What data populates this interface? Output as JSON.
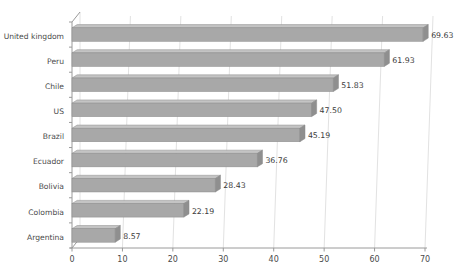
{
  "chart_data": {
    "type": "bar",
    "orientation": "horizontal",
    "title": "",
    "subtitle": "",
    "xlabel": "",
    "ylabel": "",
    "categories": [
      "United kingdom",
      "Peru",
      "Chile",
      "US",
      "Brazil",
      "Ecuador",
      "Bolivia",
      "Colombia",
      "Argentina"
    ],
    "values": [
      69.63,
      61.93,
      51.83,
      47.5,
      45.19,
      36.76,
      28.43,
      22.19,
      8.57
    ],
    "value_labels": [
      "69.63",
      "61.93",
      "51.83",
      "47.50",
      "45.19",
      "36.76",
      "28.43",
      "22.19",
      "8.57"
    ],
    "xlim": [
      0,
      70
    ],
    "xticks": [
      0,
      10,
      20,
      30,
      40,
      50,
      60,
      70
    ],
    "xtick_labels": [
      "0",
      "10",
      "20",
      "30",
      "40",
      "50",
      "60",
      "70"
    ],
    "grid": "vertical",
    "legend": "none",
    "style": "3d-bar",
    "colors": {
      "bar_fill": "#a8a8a8",
      "bar_top_highlight": "#c4c4c4",
      "bar_end_cap": "#8f8f8f",
      "bar_outline": "#8a8a8a",
      "gridline": "#e2e2e2",
      "axis": "#9a9a9a",
      "background": "#ffffff",
      "text": "#4a4a4a"
    }
  }
}
